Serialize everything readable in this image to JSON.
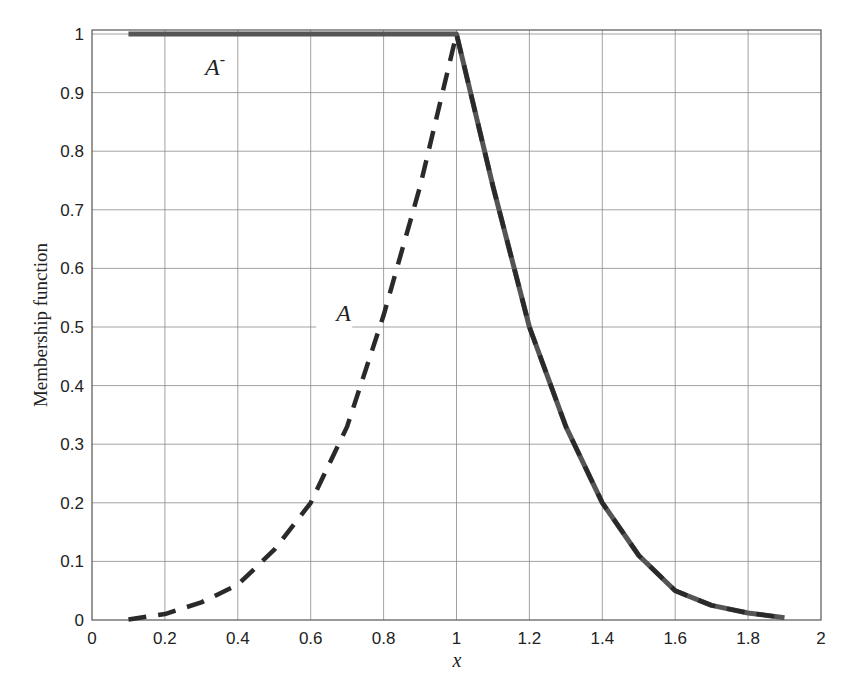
{
  "chart_data": {
    "type": "line",
    "title": "",
    "xlabel": "x",
    "ylabel": "Membership function",
    "xlim": [
      0,
      2
    ],
    "ylim": [
      0,
      1
    ],
    "grid": true,
    "legend": "none (inline labels)",
    "x_ticks": [
      "0",
      "0.2",
      "0.4",
      "0.6",
      "0.8",
      "1",
      "1.2",
      "1.4",
      "1.6",
      "1.8",
      "2"
    ],
    "y_ticks": [
      "0",
      "0.1",
      "0.2",
      "0.3",
      "0.4",
      "0.5",
      "0.6",
      "0.7",
      "0.8",
      "0.9",
      "1"
    ],
    "annotations": [
      {
        "text": "A",
        "superscript": "-",
        "x": 0.31,
        "y": 0.93,
        "series": "A-"
      },
      {
        "text": "A",
        "superscript": "",
        "x": 0.67,
        "y": 0.51,
        "series": "A"
      }
    ],
    "series": [
      {
        "name": "A",
        "style": "dashed",
        "color": "#2a2a2a",
        "x": [
          0.1,
          0.2,
          0.3,
          0.4,
          0.5,
          0.6,
          0.7,
          0.8,
          0.9,
          1.0,
          1.1,
          1.2,
          1.3,
          1.4,
          1.5,
          1.6,
          1.7,
          1.8,
          1.9
        ],
        "y": [
          0.001,
          0.01,
          0.03,
          0.06,
          0.12,
          0.2,
          0.33,
          0.52,
          0.74,
          1.0,
          0.74,
          0.5,
          0.33,
          0.2,
          0.11,
          0.05,
          0.025,
          0.012,
          0.004
        ]
      },
      {
        "name": "A-",
        "style": "solid",
        "color": "#555555",
        "x": [
          0.1,
          0.2,
          0.3,
          0.4,
          0.5,
          0.6,
          0.7,
          0.8,
          0.9,
          1.0,
          1.1,
          1.2,
          1.3,
          1.4,
          1.5,
          1.6,
          1.7,
          1.8,
          1.9
        ],
        "y": [
          1,
          1,
          1,
          1,
          1,
          1,
          1,
          1,
          1,
          1.0,
          0.74,
          0.5,
          0.33,
          0.2,
          0.11,
          0.05,
          0.025,
          0.012,
          0.004
        ]
      }
    ]
  }
}
